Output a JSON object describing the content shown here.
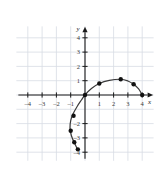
{
  "chart_data": {
    "type": "scatter",
    "title": "",
    "subtitle": "",
    "xlabel": "x",
    "ylabel": "y",
    "xlim": [
      -4.8,
      4.8
    ],
    "ylim": [
      -4.6,
      4.8
    ],
    "grid": true,
    "grid_step": 1,
    "grid_color": "#d8dce4",
    "axis_color": "#1a1a1a",
    "curve_color": "#3a3a3a",
    "point_color": "#111111",
    "legend": null,
    "legend_position": "none",
    "xticks": [
      -4,
      -3,
      -2,
      -1,
      1,
      2,
      3,
      4
    ],
    "xtick_labels": [
      "–4",
      "–3",
      "–2",
      "–1",
      "1",
      "2",
      "3",
      "4"
    ],
    "yticks": [
      4,
      3,
      2,
      1,
      -2,
      -3,
      -4
    ],
    "ytick_labels": [
      "4",
      "3",
      "2",
      "1",
      "–2",
      "–3",
      "–4"
    ],
    "series": [
      {
        "name": "plotted points",
        "marker": "filled-circle",
        "points": [
          {
            "x": -0.5,
            "y": -3.8
          },
          {
            "x": -0.75,
            "y": -3.3
          },
          {
            "x": -1.0,
            "y": -2.5
          },
          {
            "x": -0.8,
            "y": -1.45
          },
          {
            "x": 0,
            "y": 0
          },
          {
            "x": 1.0,
            "y": 0.8
          },
          {
            "x": 2.5,
            "y": 1.1
          },
          {
            "x": 3.4,
            "y": 0.75
          },
          {
            "x": 4.0,
            "y": 0
          }
        ]
      }
    ],
    "curve": {
      "name": "fitted curve through points",
      "description": "smooth sideways parabola-like curve opening left, passing through the plotted points",
      "path_points": [
        {
          "x": -0.5,
          "y": -3.85
        },
        {
          "x": -0.72,
          "y": -3.4
        },
        {
          "x": -0.95,
          "y": -2.85
        },
        {
          "x": -1.05,
          "y": -2.3
        },
        {
          "x": -1.0,
          "y": -1.8
        },
        {
          "x": -0.85,
          "y": -1.35
        },
        {
          "x": -0.55,
          "y": -0.8
        },
        {
          "x": -0.25,
          "y": -0.35
        },
        {
          "x": 0,
          "y": 0
        },
        {
          "x": 0.45,
          "y": 0.45
        },
        {
          "x": 1.0,
          "y": 0.8
        },
        {
          "x": 1.7,
          "y": 1.02
        },
        {
          "x": 2.5,
          "y": 1.1
        },
        {
          "x": 3.0,
          "y": 0.98
        },
        {
          "x": 3.4,
          "y": 0.75
        },
        {
          "x": 3.75,
          "y": 0.42
        },
        {
          "x": 4.0,
          "y": 0
        }
      ]
    }
  }
}
